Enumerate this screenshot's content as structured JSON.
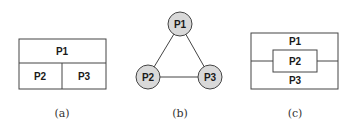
{
  "panels": [
    {
      "id": "a",
      "caption": "(a)",
      "type": "partition-box",
      "cells": [
        "P1",
        "P2",
        "P3"
      ]
    },
    {
      "id": "b",
      "caption": "(b)",
      "type": "triangle-graph",
      "nodes": [
        "P1",
        "P2",
        "P3"
      ],
      "edges": [
        [
          "P1",
          "P2"
        ],
        [
          "P1",
          "P3"
        ],
        [
          "P2",
          "P3"
        ]
      ],
      "node_fill": "#d9d9d9"
    },
    {
      "id": "c",
      "caption": "(c)",
      "type": "nested-box",
      "labels": [
        "P1",
        "P2",
        "P3"
      ]
    }
  ],
  "colors": {
    "stroke": "#444444",
    "text": "#1a1a1a",
    "node_fill": "#d9d9d9"
  }
}
